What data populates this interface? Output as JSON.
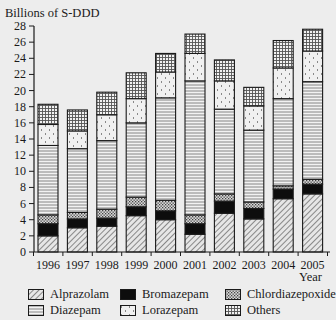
{
  "chart_data": {
    "type": "bar",
    "stacked": true,
    "title": "",
    "ylabel": "Billions of S-DDD",
    "xlabel": "Year",
    "ylim": [
      0,
      28
    ],
    "yticks": [
      0,
      2,
      4,
      6,
      8,
      10,
      12,
      14,
      16,
      18,
      20,
      22,
      24,
      26,
      28
    ],
    "grid": false,
    "legend_position": "bottom",
    "categories": [
      "1996",
      "1997",
      "1998",
      "1999",
      "2000",
      "2001",
      "2002",
      "2003",
      "2004",
      "2005"
    ],
    "series": [
      {
        "name": "Alprazolam",
        "pattern": "diagonal-hatch",
        "values": [
          2.0,
          3.0,
          3.2,
          4.5,
          4.0,
          2.2,
          4.8,
          4.1,
          6.6,
          7.2
        ]
      },
      {
        "name": "Bromazepam",
        "pattern": "solid-black",
        "values": [
          1.5,
          1.1,
          1.0,
          1.1,
          1.1,
          1.3,
          1.5,
          1.3,
          1.2,
          1.2
        ]
      },
      {
        "name": "Chlordiazepoxide",
        "pattern": "dense-dots",
        "values": [
          1.1,
          0.8,
          1.1,
          1.2,
          1.3,
          1.1,
          0.9,
          0.8,
          0.4,
          0.6
        ]
      },
      {
        "name": "Diazepam",
        "pattern": "horizontal-lines",
        "values": [
          8.6,
          7.9,
          8.5,
          9.2,
          12.7,
          16.6,
          10.5,
          8.9,
          10.8,
          12.1
        ]
      },
      {
        "name": "Lorazepam",
        "pattern": "sparse-dots",
        "values": [
          2.6,
          2.2,
          3.2,
          3.0,
          3.2,
          3.4,
          3.5,
          3.0,
          3.8,
          3.8
        ]
      },
      {
        "name": "Others",
        "pattern": "grid",
        "values": [
          2.5,
          2.6,
          2.8,
          3.2,
          2.3,
          2.4,
          2.6,
          2.3,
          3.4,
          2.7
        ]
      }
    ],
    "totals": [
      18.3,
      17.6,
      19.8,
      22.2,
      24.6,
      27.0,
      23.8,
      20.4,
      26.2,
      27.6
    ]
  },
  "legend": {
    "items": [
      {
        "label": "Alprazolam",
        "pattern": "diagonal-hatch"
      },
      {
        "label": "Bromazepam",
        "pattern": "solid-black"
      },
      {
        "label": "Chlordiazepoxide",
        "pattern": "dense-dots"
      },
      {
        "label": "Diazepam",
        "pattern": "horizontal-lines"
      },
      {
        "label": "Lorazepam",
        "pattern": "sparse-dots"
      },
      {
        "label": "Others",
        "pattern": "grid"
      }
    ]
  },
  "colors": {
    "background": "#ededed",
    "ink": "#1a1a1a",
    "bar_fill": "#ffffff"
  }
}
